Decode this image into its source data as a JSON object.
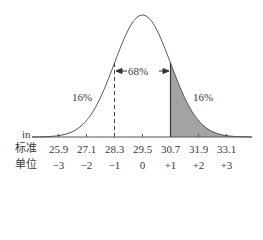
{
  "chart_data": {
    "type": "area",
    "title": "",
    "mean": 29.5,
    "sd": 1.2,
    "unit_label": "in",
    "x_values": [
      25.9,
      27.1,
      28.3,
      29.5,
      30.7,
      31.9,
      33.1
    ],
    "sd_units": [
      "−3",
      "−2",
      "−1",
      "0",
      "+1",
      "+2",
      "+3"
    ],
    "row_labels": {
      "values": "标准",
      "units": "单位"
    },
    "annotations": {
      "center": "68%",
      "left_tail": "16%",
      "right_tail": "16%"
    },
    "shaded_region": {
      "from": 30.7,
      "to": "+inf",
      "color": "#a3a3a3"
    },
    "dashed_line_at": 28.3,
    "solid_line_at": 30.7,
    "grid": false,
    "legend": null
  },
  "colors": {
    "curve": "#555555",
    "shade": "#a3a3a3",
    "text": "#3a3a3a"
  }
}
